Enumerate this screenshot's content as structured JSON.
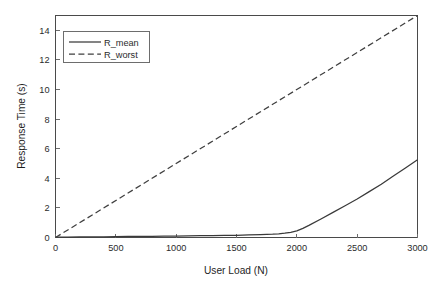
{
  "chart_data": {
    "type": "line",
    "title": "",
    "xlabel": "User Load (N)",
    "ylabel": "Response Time (s)",
    "xlim": [
      0,
      3000
    ],
    "ylim": [
      0,
      15
    ],
    "grid": false,
    "legend_position": "top-left",
    "xticks": [
      0,
      500,
      1000,
      1500,
      2000,
      2500,
      3000
    ],
    "xticklabels": [
      "0",
      "500",
      "1000",
      "1500",
      "2000",
      "2500",
      "3000"
    ],
    "yticks": [
      0,
      2,
      4,
      6,
      8,
      10,
      12,
      14
    ],
    "yticklabels": [
      "0",
      "2",
      "4",
      "6",
      "8",
      "10",
      "12",
      "14"
    ],
    "series": [
      {
        "name": "R_mean",
        "style": "solid",
        "color": "#3a3a3a",
        "x": [
          0,
          100,
          200,
          300,
          400,
          500,
          600,
          700,
          800,
          900,
          1000,
          1100,
          1200,
          1300,
          1400,
          1500,
          1600,
          1700,
          1800,
          1850,
          1900,
          1950,
          2000,
          2050,
          2100,
          2200,
          2300,
          2400,
          2500,
          2600,
          2700,
          2800,
          2900,
          3000
        ],
        "values": [
          0.02,
          0.03,
          0.04,
          0.05,
          0.05,
          0.06,
          0.07,
          0.07,
          0.08,
          0.09,
          0.1,
          0.11,
          0.12,
          0.13,
          0.14,
          0.15,
          0.17,
          0.19,
          0.22,
          0.25,
          0.29,
          0.35,
          0.45,
          0.62,
          0.82,
          1.25,
          1.7,
          2.15,
          2.6,
          3.1,
          3.6,
          4.15,
          4.7,
          5.25
        ]
      },
      {
        "name": "R_worst",
        "style": "dashed",
        "color": "#3f3f3f",
        "x": [
          0,
          3000
        ],
        "values": [
          0.0,
          15.0
        ]
      }
    ],
    "annotations": []
  },
  "legend": {
    "entries": [
      {
        "label": "R_mean"
      },
      {
        "label": "R_worst"
      }
    ]
  },
  "colors": {
    "background": "#ffffff",
    "axis": "#4a4a4a",
    "text": "#2b2b2b",
    "series_mean": "#3a3a3a",
    "series_worst": "#3f3f3f"
  }
}
